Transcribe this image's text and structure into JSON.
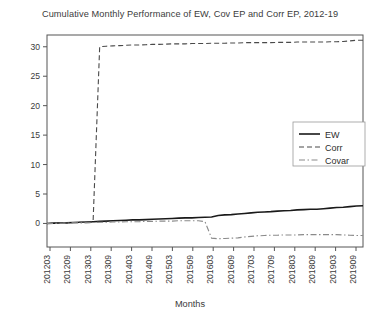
{
  "chart_data": {
    "type": "line",
    "title": "Cumulative Monthly Performance of EW, Cov EP and Corr EP, 2012-19",
    "xlabel": "Months",
    "ylabel": "",
    "grid": false,
    "legend_position": "right",
    "ylim": [
      -4,
      32
    ],
    "yticks": [
      0,
      5,
      10,
      15,
      20,
      25,
      30
    ],
    "ytick_labels": [
      "0",
      "5",
      "10",
      "15",
      "20",
      "25",
      "30"
    ],
    "xtick_labels": [
      "201203",
      "201209",
      "201303",
      "201309",
      "201403",
      "201409",
      "201503",
      "201509",
      "201603",
      "201609",
      "201703",
      "201709",
      "201803",
      "201809",
      "201903",
      "201909"
    ],
    "x": [
      "201201",
      "201203",
      "201205",
      "201207",
      "201209",
      "201211",
      "201301",
      "201302",
      "201303",
      "201305",
      "201307",
      "201309",
      "201311",
      "201401",
      "201403",
      "201405",
      "201407",
      "201409",
      "201411",
      "201501",
      "201503",
      "201505",
      "201507",
      "201509",
      "201511",
      "201601",
      "201603",
      "201605",
      "201607",
      "201609",
      "201611",
      "201701",
      "201703",
      "201705",
      "201707",
      "201709",
      "201711",
      "201801",
      "201803",
      "201805",
      "201807",
      "201809",
      "201811",
      "201901",
      "201903",
      "201905",
      "201907",
      "201909",
      "201912"
    ],
    "series": [
      {
        "name": "EW",
        "style": "solid",
        "color": "#1a1a1a",
        "values": [
          0.0,
          0.05,
          0.1,
          0.1,
          0.15,
          0.2,
          0.25,
          0.3,
          0.35,
          0.4,
          0.45,
          0.5,
          0.55,
          0.6,
          0.6,
          0.65,
          0.7,
          0.75,
          0.8,
          0.85,
          0.9,
          0.95,
          0.95,
          1.0,
          1.05,
          1.1,
          1.35,
          1.45,
          1.5,
          1.6,
          1.7,
          1.8,
          1.9,
          1.95,
          2.0,
          2.1,
          2.15,
          2.2,
          2.3,
          2.35,
          2.4,
          2.4,
          2.5,
          2.6,
          2.7,
          2.75,
          2.85,
          2.95,
          3.0
        ]
      },
      {
        "name": "Corr",
        "style": "dashed",
        "color": "#4a4a4a",
        "values": [
          0.0,
          0.05,
          0.1,
          0.1,
          0.15,
          0.2,
          0.2,
          0.25,
          30.0,
          30.1,
          30.15,
          30.2,
          30.25,
          30.3,
          30.3,
          30.35,
          30.4,
          30.4,
          30.45,
          30.5,
          30.5,
          30.5,
          30.55,
          30.55,
          30.55,
          30.6,
          30.6,
          30.6,
          30.65,
          30.65,
          30.7,
          30.7,
          30.7,
          30.7,
          30.7,
          30.75,
          30.75,
          30.75,
          30.8,
          30.8,
          30.8,
          30.8,
          30.8,
          30.85,
          30.85,
          30.9,
          31.0,
          31.1,
          31.1
        ]
      },
      {
        "name": "Covar",
        "style": "dashdot",
        "color": "#8a8a8a",
        "values": [
          0.0,
          0.0,
          0.05,
          0.05,
          0.1,
          0.1,
          0.1,
          0.15,
          0.2,
          0.2,
          0.25,
          0.25,
          0.3,
          0.3,
          0.3,
          0.35,
          0.35,
          0.4,
          0.4,
          0.4,
          0.45,
          0.45,
          0.45,
          0.45,
          0.3,
          -2.5,
          -2.6,
          -2.55,
          -2.5,
          -2.45,
          -2.3,
          -2.2,
          -2.1,
          -2.05,
          -2.0,
          -2.0,
          -1.95,
          -1.95,
          -1.95,
          -1.9,
          -1.9,
          -1.9,
          -1.9,
          -1.9,
          -1.9,
          -1.95,
          -2.0,
          -2.05,
          -2.05
        ]
      }
    ],
    "legend_entries": [
      {
        "label": "EW",
        "style": "solid"
      },
      {
        "label": "Corr",
        "style": "dashed"
      },
      {
        "label": "Covar",
        "style": "dashdot"
      }
    ]
  }
}
